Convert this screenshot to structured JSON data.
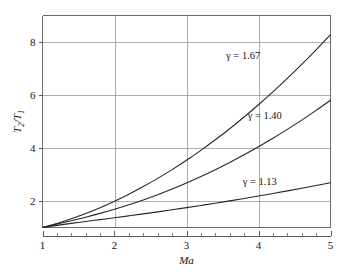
{
  "chart_data": {
    "type": "line",
    "title": "",
    "subtitle": "",
    "xlabel": "Ma",
    "ylabel": "T2/T1",
    "ylabel_main": "T",
    "ylabel_num_sub": "2",
    "ylabel_slash": "/T",
    "ylabel_den_sub": "1",
    "xlim": [
      1,
      5
    ],
    "ylim": [
      1,
      9
    ],
    "xticks": [
      1,
      2,
      3,
      4,
      5
    ],
    "xtick_labels": [
      "1",
      "2",
      "3",
      "4",
      "5"
    ],
    "yticks": [
      2,
      4,
      6,
      8
    ],
    "ytick_labels": [
      "2",
      "4",
      "6",
      "8"
    ],
    "x_minor_tick_step": 0.2,
    "grid": true,
    "grid_axes": "both",
    "grid_color": "#9a9a9a",
    "axis_color": "#6b6b6b",
    "curve_color": "#262626",
    "background_color": "#ffffff",
    "legend_position": "inline-annotations",
    "x": [
      1,
      1.2,
      1.4,
      1.6,
      1.8,
      2,
      2.2,
      2.4,
      2.6,
      2.8,
      3,
      3.2,
      3.4,
      3.6,
      3.8,
      4,
      4.2,
      4.4,
      4.6,
      4.8,
      5
    ],
    "series": [
      {
        "name": "gamma = 1.67",
        "annotation": "γ = 1.67",
        "gamma": 1.67,
        "annotation_x": 3.55,
        "annotation_y": 7.35,
        "values": [
          1,
          1.153,
          1.33,
          1.528,
          1.749,
          1.992,
          2.257,
          2.544,
          2.853,
          3.184,
          3.537,
          3.912,
          4.309,
          4.728,
          5.169,
          5.633,
          6.118,
          6.625,
          7.155,
          7.706,
          8.28
        ]
      },
      {
        "name": "gamma = 1.40",
        "annotation": "γ = 1.40",
        "gamma": 1.4,
        "annotation_x": 3.85,
        "annotation_y": 5.1,
        "values": [
          1,
          1.128,
          1.255,
          1.388,
          1.532,
          1.688,
          1.857,
          2.04,
          2.238,
          2.451,
          2.679,
          2.922,
          3.18,
          3.454,
          3.743,
          4.047,
          4.367,
          4.702,
          5.052,
          5.418,
          5.8
        ]
      },
      {
        "name": "gamma = 1.13",
        "annotation": "γ = 1.13",
        "gamma": 1.13,
        "annotation_x": 3.78,
        "annotation_y": 2.62,
        "values": [
          1,
          1.081,
          1.155,
          1.226,
          1.297,
          1.368,
          1.441,
          1.515,
          1.591,
          1.669,
          1.75,
          1.833,
          1.918,
          2.006,
          2.096,
          2.189,
          2.284,
          2.382,
          2.482,
          2.585,
          2.69
        ]
      }
    ]
  }
}
